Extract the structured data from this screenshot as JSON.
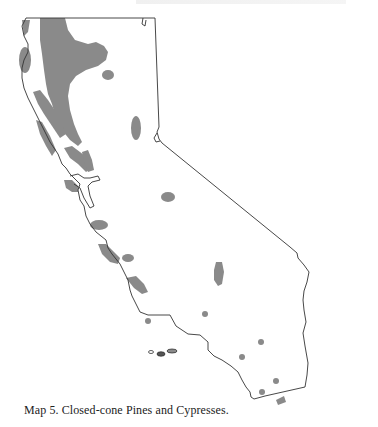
{
  "figure": {
    "caption": "Map 5.  Closed-cone Pines and Cypresses.",
    "region": "California",
    "colors": {
      "background": "#ffffff",
      "outline": "#333333",
      "distribution_fill": "#8a8a8a"
    }
  }
}
